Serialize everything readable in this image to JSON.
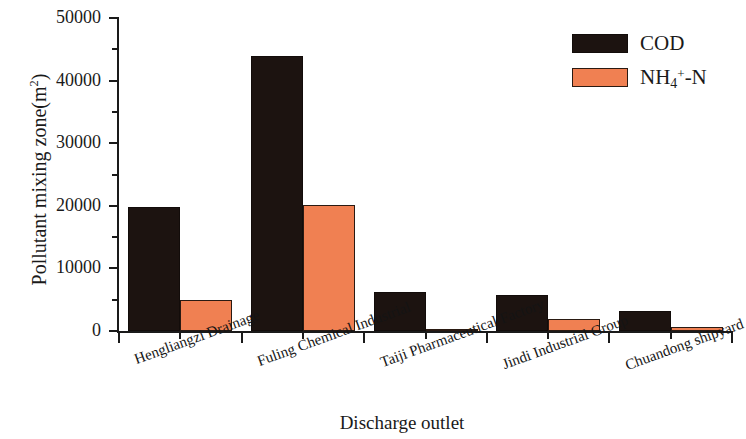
{
  "chart_data": {
    "type": "bar",
    "title": "",
    "subtitle": "",
    "xlabel": "Discharge outlet",
    "ylabel": "Pollutant mixing zone(m2)",
    "ylabel_base": "Pollutant mixing zone(m",
    "ylabel_exp": "2",
    "ylabel_tail": ")",
    "categories": [
      "Hengliangzi Drainage",
      "Fuling Chemical Industrial",
      "Taiji Pharmaceutical Factory",
      "Jindi Industrial Group",
      "Chuandong shipyard"
    ],
    "series": [
      {
        "name": "COD",
        "color": "#1c1310",
        "values": [
          19800,
          44000,
          6200,
          5750,
          3200
        ]
      },
      {
        "name": "NH4+-N",
        "color": "#f08052",
        "values": [
          4950,
          20200,
          400,
          1900,
          700
        ]
      }
    ],
    "legend": [
      {
        "label": "COD",
        "label_base": "COD",
        "label_sub": "",
        "label_sup": "",
        "label_tail": "",
        "color": "#1c1310"
      },
      {
        "label": "NH4+-N",
        "label_base": "NH",
        "label_sub": "4",
        "label_sup": "+",
        "label_tail": "-N",
        "color": "#f08052"
      }
    ],
    "legend_position": "top-right",
    "ylim": [
      0,
      50000
    ],
    "yticks": [
      0,
      10000,
      20000,
      30000,
      40000,
      50000
    ],
    "ytick_labels": [
      "0",
      "10000",
      "20000",
      "30000",
      "40000",
      "50000"
    ],
    "y_minor_ticks": [
      5000,
      15000,
      25000,
      35000,
      45000
    ],
    "grid": false,
    "axis_color": "#1a1a1a",
    "background": "#ffffff",
    "xtick_label_rotation": -20
  }
}
